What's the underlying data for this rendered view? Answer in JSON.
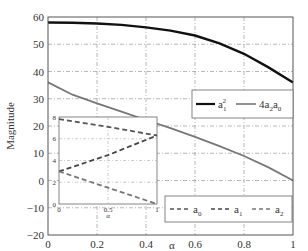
{
  "chart_data": {
    "type": "line",
    "title": "",
    "xlabel": "α",
    "ylabel": "Magnitude",
    "xlim": [
      0,
      1
    ],
    "ylim": [
      -20,
      60
    ],
    "grid": true,
    "x_ticks": [
      "0",
      "0.2",
      "0.4",
      "0.6",
      "0.8",
      "1"
    ],
    "y_ticks": [
      "60",
      "50",
      "40",
      "30",
      "20",
      "10",
      "0",
      "−10",
      "−20"
    ],
    "x": [
      0,
      0.1,
      0.2,
      0.3,
      0.4,
      0.5,
      0.6,
      0.7,
      0.8,
      0.9,
      1.0
    ],
    "series": [
      {
        "name": "a1^2",
        "legend_label": "a",
        "legend_sub": "1",
        "legend_sup": "2",
        "style": "solid",
        "color": "#111111",
        "values": [
          58,
          57.9,
          57.6,
          57.1,
          56.2,
          55,
          53.2,
          50.3,
          46.5,
          41.5,
          36
        ]
      },
      {
        "name": "4a2a0",
        "legend_label": "4a",
        "legend_sub2": "2",
        "legend_mid": "a",
        "legend_sub": "0",
        "style": "solid",
        "color": "#777777",
        "values": [
          36,
          31.5,
          28.3,
          25.3,
          22.2,
          19.2,
          16,
          12.6,
          9,
          4.8,
          0
        ]
      }
    ],
    "legend_position": "upper-right (inside, mid-height)",
    "inset": {
      "xlabel": "α",
      "xlim": [
        0,
        1
      ],
      "ylim": [
        0,
        8
      ],
      "x_ticks": [
        "0",
        "0.5",
        "1"
      ],
      "y_ticks": [
        "8",
        "6",
        "4",
        "2",
        "0"
      ],
      "x": [
        0,
        0.5,
        1
      ],
      "series": [
        {
          "name": "a0",
          "style": "dashed",
          "color": "#555555",
          "values": [
            7.8,
            7.1,
            6.3
          ]
        },
        {
          "name": "a1",
          "style": "dashed",
          "color": "#444444",
          "values": [
            3.0,
            4.5,
            6.3
          ]
        },
        {
          "name": "a2",
          "style": "dashed",
          "color": "#777777",
          "values": [
            3.0,
            1.5,
            0.0
          ]
        }
      ]
    },
    "legend2": {
      "position": "lower-right",
      "entries": [
        {
          "label": "a",
          "sub": "0",
          "style": "dashed"
        },
        {
          "label": "a",
          "sub": "1",
          "style": "dashed"
        },
        {
          "label": "a",
          "sub": "2",
          "style": "dashed"
        }
      ]
    }
  }
}
